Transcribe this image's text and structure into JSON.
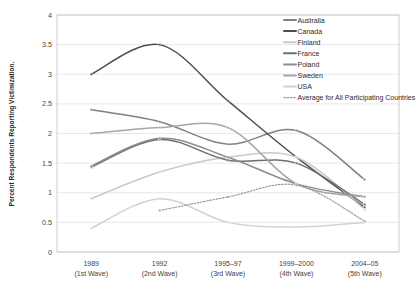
{
  "chart_data": {
    "type": "line",
    "title": "",
    "xlabel": "",
    "ylabel": "Percent Respondents Reporting Victimization.",
    "ylim": [
      0,
      4
    ],
    "ytick_values": [
      0,
      0.5,
      1,
      1.5,
      2,
      2.5,
      3,
      3.5,
      4
    ],
    "ytick_labels": [
      "0",
      "0.5",
      "1",
      "1.5",
      "2",
      "2.5",
      "3",
      "3.5",
      "4"
    ],
    "grid": true,
    "legend_position": "top-right",
    "categories": [
      "1989",
      "1992",
      "1995–97",
      "1999–2000",
      "2004–05"
    ],
    "category_sublabels": [
      "(1st Wave)",
      "(2nd Wave)",
      "(3rd Wave)",
      "(4th Wave)",
      "(5th Wave)"
    ],
    "series": [
      {
        "name": "Australia",
        "color": "#808080",
        "style": "solid",
        "values": [
          2.4,
          2.2,
          1.82,
          2.05,
          1.22
        ]
      },
      {
        "name": "Canada",
        "color": "#4f4f4f",
        "style": "solid",
        "values": [
          3.0,
          3.5,
          2.55,
          1.6,
          0.75
        ]
      },
      {
        "name": "Finland",
        "color": "#c9c9c9",
        "style": "solid",
        "values": [
          0.9,
          1.35,
          1.6,
          1.6,
          0.72
        ]
      },
      {
        "name": "France",
        "color": "#6e6e6e",
        "style": "solid",
        "values": [
          1.43,
          1.9,
          1.55,
          1.5,
          0.8
        ]
      },
      {
        "name": "Poland",
        "color": "#8c8c8c",
        "style": "solid",
        "values": [
          1.45,
          1.92,
          1.6,
          1.15,
          0.93
        ]
      },
      {
        "name": "Sweden",
        "color": "#a6a6a6",
        "style": "solid",
        "values": [
          2.0,
          2.1,
          2.1,
          1.15,
          0.93
        ]
      },
      {
        "name": "USA",
        "color": "#d2d2d2",
        "style": "solid",
        "values": [
          0.4,
          0.9,
          0.5,
          0.42,
          0.5
        ]
      },
      {
        "name": "Average for All Participating Countries",
        "color": "#9b9b9b",
        "style": "dotted",
        "values": [
          null,
          0.7,
          0.93,
          1.13,
          0.52
        ]
      }
    ]
  }
}
